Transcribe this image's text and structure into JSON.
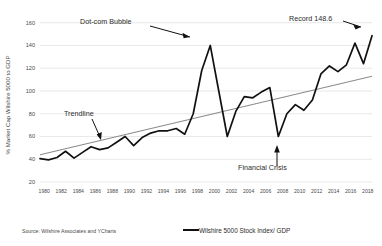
{
  "chart_data": {
    "type": "line",
    "title": "",
    "xlabel": "",
    "ylabel": "% Market Cap Wilshire 5000 to GDP",
    "xlim": [
      1980,
      2019
    ],
    "ylim": [
      20,
      165
    ],
    "grid": true,
    "legend_position": "bottom-center",
    "y_ticks": [
      20,
      40,
      60,
      80,
      100,
      120,
      140,
      160
    ],
    "x_ticks": [
      1980,
      1982,
      1984,
      1986,
      1988,
      1990,
      1992,
      1994,
      1996,
      1998,
      2000,
      2002,
      2004,
      2006,
      2008,
      2010,
      2012,
      2014,
      2016,
      2018
    ],
    "series": [
      {
        "name": "Wilshire 5000 Stock Index/ GDP",
        "color": "#111111",
        "x": [
          1980,
          1981,
          1982,
          1983,
          1984,
          1985,
          1986,
          1987,
          1988,
          1989,
          1990,
          1991,
          1992,
          1993,
          1994,
          1995,
          1996,
          1997,
          1998,
          1999,
          2000,
          2001,
          2002,
          2003,
          2004,
          2005,
          2006,
          2007,
          2008,
          2009,
          2010,
          2011,
          2012,
          2013,
          2014,
          2015,
          2016,
          2017,
          2018,
          2019
        ],
        "values": [
          40.5,
          39.5,
          41.5,
          47,
          41,
          46,
          51,
          48.5,
          50,
          55,
          60,
          52,
          59,
          63,
          65,
          65,
          67,
          62,
          80,
          118,
          140,
          100,
          60,
          82,
          95,
          94,
          99,
          103,
          60,
          80,
          88,
          83,
          92,
          115,
          122,
          117,
          123,
          142,
          124,
          148.6
        ]
      },
      {
        "name": "Trendline",
        "color": "#8c8c8c",
        "x": [
          1980,
          2019
        ],
        "values": [
          44,
          113
        ]
      }
    ],
    "annotations": [
      {
        "label": "Dot-com Bubble",
        "target_x": 2000,
        "target_y": 140
      },
      {
        "label": "Record 148.6",
        "target_x": 2019,
        "target_y": 148.6
      },
      {
        "label": "Financial Crisis",
        "target_x": 2008,
        "target_y": 60
      },
      {
        "label": "Trendline",
        "target_x": 1988,
        "target_y": 66
      }
    ],
    "legend": [
      {
        "label": "Wilshire 5000 Stock Index/ GDP",
        "color": "#111111"
      }
    ],
    "source": "Source: Wilshire Associates and YCharts"
  },
  "colors": {
    "series": "#111111",
    "trendline": "#8c8c8c",
    "grid": "#d9d9d9",
    "background": "#ffffff"
  }
}
